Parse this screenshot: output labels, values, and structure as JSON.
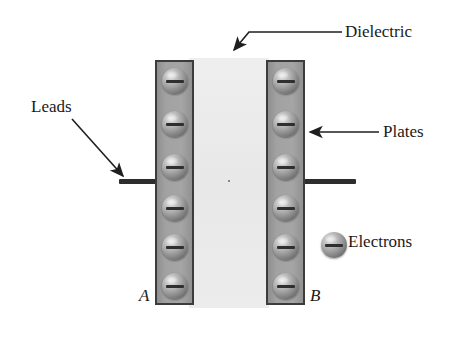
{
  "figure": {
    "background_color": "#ffffff"
  },
  "colors": {
    "plate_fill": "#9b9b9b",
    "plate_border": "#3c3c3c",
    "dielectric_fill": "#ececec",
    "lead_color": "#2d2d2d",
    "electron_body": "#9d9d9d",
    "electron_sign": "#2f2f2f",
    "text_color": "#1a1a1a"
  },
  "labels": {
    "dielectric": "Dielectric",
    "plates": "Plates",
    "electrons": "Electrons",
    "leads": "Leads",
    "plate_a": "A",
    "plate_b": "B"
  },
  "components": {
    "plates": [
      {
        "name": "A",
        "side": "left",
        "electron_count": 6
      },
      {
        "name": "B",
        "side": "right",
        "electron_count": 6
      }
    ],
    "dielectric": {
      "between": [
        "A",
        "B"
      ]
    },
    "leads": [
      {
        "attached_to": "A",
        "side": "left"
      },
      {
        "attached_to": "B",
        "side": "right"
      }
    ],
    "electron_symbol": "minus-sign-sphere"
  },
  "electron_rows_y": [
    79,
    122,
    165,
    206,
    245,
    284
  ],
  "icons": {
    "arrow_dielectric": "arrow-down-left",
    "arrow_plates": "arrow-left",
    "arrow_leads": "arrow-down-right"
  }
}
